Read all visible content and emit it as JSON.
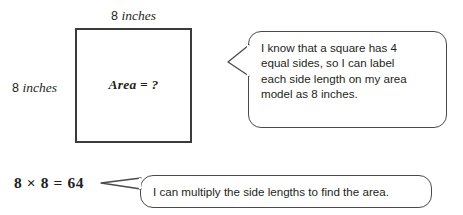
{
  "diagram": {
    "background_color": "#ffffff",
    "line_color": "#3b3b3b",
    "text_color": "#231f20"
  },
  "area_model": {
    "top_label": {
      "number": "8",
      "unit": "inches"
    },
    "left_label": {
      "number": "8",
      "unit": "inches"
    },
    "inner_label": "Area = ?"
  },
  "equation": "8 × 8 = 64",
  "bubbles": [
    {
      "id": "bubble-1",
      "lines": [
        "I know that a square has 4",
        "equal sides, so I can label",
        "each side length on my area",
        "model as 8 inches."
      ],
      "text": "I know that a square has 4 equal sides, so I can label each side length on my area model as 8 inches."
    },
    {
      "id": "bubble-2",
      "lines": [
        "I can multiply the side lengths to find the area."
      ],
      "text": "I can multiply the side lengths to find the area."
    }
  ]
}
